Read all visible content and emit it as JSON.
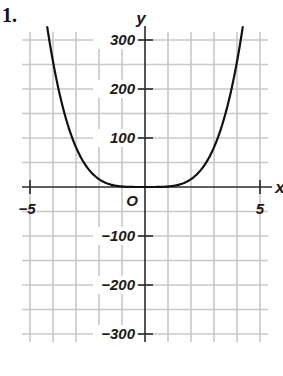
{
  "problem_number": "1.",
  "colors": {
    "grid": "#c8c8c8",
    "axis": "#2a2a2a",
    "curve": "#111111",
    "text": "#1a1a1a"
  },
  "chart_data": {
    "type": "line",
    "title": "",
    "xlabel": "x",
    "ylabel": "y",
    "origin_label": "O",
    "xlim": [
      -5,
      5
    ],
    "ylim": [
      -300,
      300
    ],
    "x_grid_step": 1,
    "y_grid_step": 50,
    "grid": true,
    "x_tick_labels": [
      {
        "value": -5,
        "label": "−5"
      },
      {
        "value": 5,
        "label": "5"
      }
    ],
    "y_tick_labels": [
      {
        "value": 300,
        "label": "300"
      },
      {
        "value": 200,
        "label": "200"
      },
      {
        "value": 100,
        "label": "100"
      },
      {
        "value": -100,
        "label": "−100"
      },
      {
        "value": -200,
        "label": "−200"
      },
      {
        "value": -300,
        "label": "−300"
      }
    ],
    "series": [
      {
        "name": "y = x^4",
        "x": [
          -4.25,
          -4,
          -3.5,
          -3,
          -2.5,
          -2,
          -1.5,
          -1,
          -0.5,
          0,
          0.5,
          1,
          1.5,
          2,
          2.5,
          3,
          3.5,
          4,
          4.25
        ],
        "values": [
          326.3,
          256,
          150.1,
          81,
          39.1,
          16,
          5.1,
          1,
          0.06,
          0,
          0.06,
          1,
          5.1,
          16,
          39.1,
          81,
          150.1,
          256,
          326.3
        ]
      }
    ]
  }
}
